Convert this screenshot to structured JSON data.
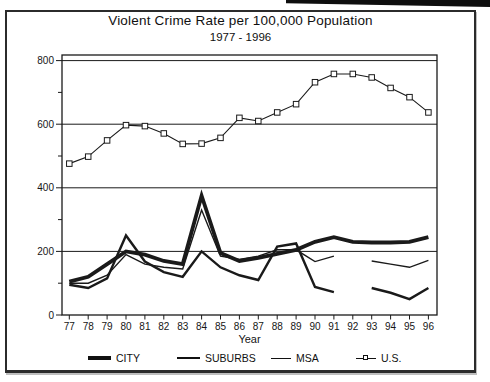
{
  "header": {
    "title": "Violent Crime Rate per 100,000 Population",
    "subtitle": "1977 - 1996"
  },
  "colors": {
    "ink": "#1a1a1a",
    "background": "#ffffff"
  },
  "chart_data": {
    "type": "line",
    "title": "Violent Crime Rate per 100,000 Population",
    "subtitle": "1977 - 1996",
    "xlabel": "Year",
    "ylabel": "",
    "ylim": [
      0,
      800
    ],
    "y_major_ticks": [
      0,
      200,
      400,
      600,
      800
    ],
    "y_minor_ticks": [
      100,
      300,
      500,
      700
    ],
    "gridlines": [
      200,
      400,
      600,
      800
    ],
    "grid": true,
    "legend_position": "bottom",
    "categories": [
      "77",
      "78",
      "79",
      "80",
      "81",
      "82",
      "83",
      "84",
      "85",
      "86",
      "87",
      "88",
      "89",
      "90",
      "91",
      "92",
      "93",
      "94",
      "95",
      "96"
    ],
    "series": [
      {
        "name": "CITY",
        "line": "thick",
        "values": [
          105,
          120,
          160,
          200,
          190,
          170,
          160,
          375,
          195,
          170,
          180,
          192,
          205,
          230,
          245,
          230,
          228,
          228,
          230,
          245
        ]
      },
      {
        "name": "SUBURBS",
        "line": "medium",
        "values": [
          95,
          85,
          115,
          250,
          168,
          135,
          120,
          200,
          150,
          125,
          110,
          215,
          225,
          88,
          72,
          null,
          85,
          70,
          50,
          85
        ]
      },
      {
        "name": "MSA",
        "line": "thin",
        "values": [
          100,
          100,
          125,
          190,
          160,
          150,
          145,
          330,
          185,
          175,
          185,
          205,
          205,
          168,
          185,
          null,
          170,
          160,
          150,
          172
        ]
      },
      {
        "name": "U.S.",
        "line": "thin",
        "marker": "open-square",
        "values": [
          476,
          498,
          549,
          597,
          594,
          571,
          538,
          539,
          557,
          620,
          610,
          637,
          663,
          732,
          758,
          758,
          747,
          714,
          685,
          637
        ]
      }
    ]
  },
  "legend": {
    "items": [
      {
        "label": "CITY"
      },
      {
        "label": "SUBURBS"
      },
      {
        "label": "MSA"
      },
      {
        "label": "U.S."
      }
    ]
  }
}
